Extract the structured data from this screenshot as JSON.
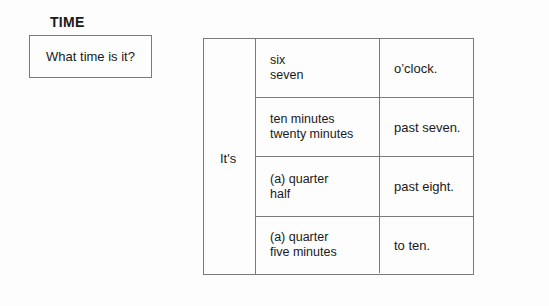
{
  "header": {
    "title": "TIME"
  },
  "question": {
    "text": "What time is it?"
  },
  "table": {
    "lead": "It's",
    "rows": [
      {
        "line1": "six",
        "line2": "seven",
        "ending": "o’clock."
      },
      {
        "line1": "ten minutes",
        "line2": "twenty minutes",
        "ending": "past seven."
      },
      {
        "line1": "(a) quarter",
        "line2": "half",
        "ending": "past eight."
      },
      {
        "line1": "(a) quarter",
        "line2": "five minutes",
        "ending": "to ten."
      }
    ]
  }
}
